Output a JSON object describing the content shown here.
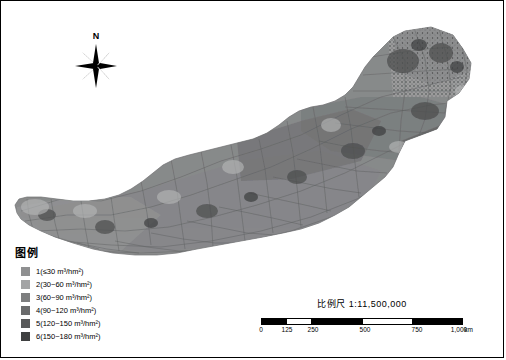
{
  "map": {
    "title_present": false,
    "north_arrow_label": "N",
    "legend": {
      "title": "图例",
      "items": [
        {
          "label": "1(≤30 m³/hm²)",
          "color": "#8f9091"
        },
        {
          "label": "2(30~60 m³/hm²)",
          "color": "#a3a4a5"
        },
        {
          "label": "3(60~90 m³/hm²)",
          "color": "#7d7e7f"
        },
        {
          "label": "4(90~120 m³/hm²)",
          "color": "#6a6b6c"
        },
        {
          "label": "5(120~150 m³/hm²)",
          "color": "#58595a"
        },
        {
          "label": "6(150~180 m³/hm²)",
          "color": "#3f4041"
        }
      ]
    },
    "scale": {
      "title": "比例尺  1:11,500,000",
      "ticks": [
        "0",
        "125",
        "250",
        "500",
        "750",
        "1,000"
      ],
      "unit": "km"
    },
    "colors": {
      "background": "#ffffff",
      "border": "#000000",
      "land_base": "#8a8b8c",
      "land_dark": "#5a5b5c",
      "land_light": "#aeafb0"
    }
  }
}
